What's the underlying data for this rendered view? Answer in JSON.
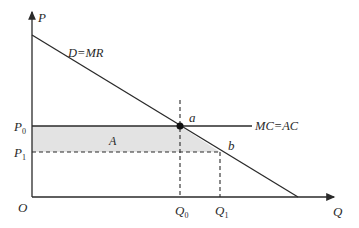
{
  "diagram": {
    "type": "economics-monopoly-welfare",
    "axes": {
      "y_label": "P",
      "x_label": "Q",
      "origin_label": "O"
    },
    "curves": {
      "demand_label": "D=MR",
      "cost_label": "MC=AC"
    },
    "price_levels": {
      "p0_main": "P",
      "p0_sub": "0",
      "p1_main": "P",
      "p1_sub": "1"
    },
    "quantity_levels": {
      "q0_main": "Q",
      "q0_sub": "0",
      "q1_main": "Q",
      "q1_sub": "1"
    },
    "points": {
      "a": "a",
      "b": "b"
    },
    "region_label": "A",
    "colors": {
      "line": "#2a2a2a",
      "shaded_area": "#e3e3e3"
    }
  }
}
